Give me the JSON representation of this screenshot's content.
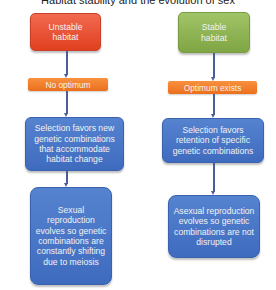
{
  "title": "Habitat stability and the evolution of sex",
  "left_branch": {
    "start": "Unstable habitat",
    "condition": "No optimum",
    "selection": "Selection favors new genetic combinations that accommodate habitat change",
    "outcome": "Sexual reproduction evolves so genetic combinations are constantly shifting due to meiosis"
  },
  "right_branch": {
    "start": "Stable habitat",
    "condition": "Optimum exists",
    "selection": "Selection favors retention of specific genetic combinations",
    "outcome": "Asexual reproduction evolves so genetic combinations are not disrupted"
  },
  "colors": {
    "unstable": "#e8512f",
    "stable": "#8cb050",
    "condition": "#f07e2a",
    "process": "#4a76c7",
    "connector": "#4a5e9a"
  }
}
